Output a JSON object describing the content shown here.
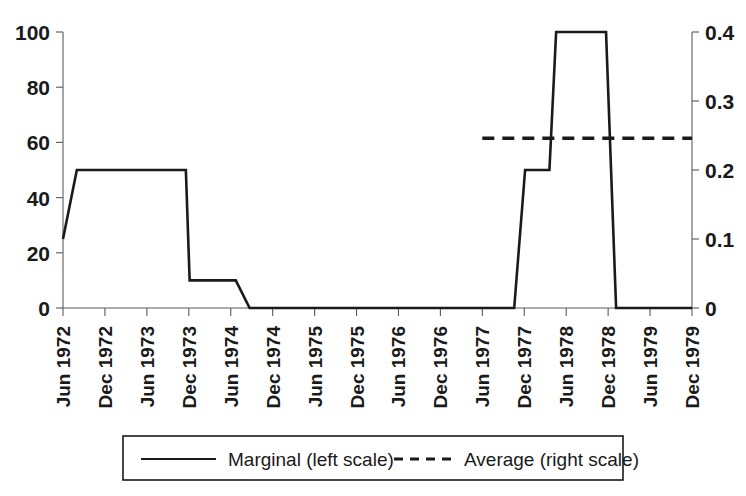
{
  "chart_data": {
    "type": "line",
    "title": "",
    "subtitle": "",
    "xlabel": "",
    "ylabel": "",
    "grid": false,
    "legend_position": "bottom",
    "x_tick_labels": [
      "Jun 1972",
      "Dec 1972",
      "Jun 1973",
      "Dec 1973",
      "Jun 1974",
      "Dec 1974",
      "Jun 1975",
      "Dec 1975",
      "Jun 1976",
      "Dec 1976",
      "Jun 1977",
      "Dec 1977",
      "Jun 1978",
      "Dec 1978",
      "Jun 1979",
      "Dec 1979"
    ],
    "left_axis": {
      "tick_labels": [
        "0",
        "20",
        "40",
        "60",
        "80",
        "100"
      ],
      "tick_values": [
        0,
        20,
        40,
        60,
        80,
        100
      ],
      "ylim": [
        0,
        100
      ]
    },
    "right_axis": {
      "tick_labels": [
        "0",
        "0.1",
        "0.2",
        "0.3",
        "0.4"
      ],
      "tick_values": [
        0,
        0.1,
        0.2,
        0.3,
        0.4
      ],
      "ylim": [
        0,
        0.4
      ]
    },
    "series": [
      {
        "name": "Marginal (left scale)",
        "axis": "left",
        "style": "solid",
        "color": "#1a1a1a",
        "points": [
          {
            "x": "Jun 1972",
            "x_index": 0.0,
            "y": 25
          },
          {
            "x": "Aug 1972",
            "x_index": 0.33,
            "y": 50
          },
          {
            "x": "Nov 1973",
            "x_index": 2.93,
            "y": 50
          },
          {
            "x": "Dec 1973",
            "x_index": 3.02,
            "y": 10
          },
          {
            "x": "Jul 1974",
            "x_index": 4.12,
            "y": 10
          },
          {
            "x": "Sep 1974",
            "x_index": 4.45,
            "y": 0
          },
          {
            "x": "Oct 1977",
            "x_index": 10.76,
            "y": 0
          },
          {
            "x": "Dec 1977",
            "x_index": 11.02,
            "y": 50
          },
          {
            "x": "Mar 1978",
            "x_index": 11.6,
            "y": 50
          },
          {
            "x": "Apr 1978",
            "x_index": 11.76,
            "y": 100
          },
          {
            "x": "Oct 1978",
            "x_index": 12.95,
            "y": 100
          },
          {
            "x": "Dec 1978",
            "x_index": 13.19,
            "y": 0
          },
          {
            "x": "Dec 1979",
            "x_index": 15.0,
            "y": 0
          }
        ]
      },
      {
        "name": "Average (right scale)",
        "axis": "right",
        "style": "dashed",
        "color": "#1a1a1a",
        "points": [
          {
            "x": "Jun 1977",
            "x_index": 10.0,
            "y": 0.246
          },
          {
            "x": "Dec 1979",
            "x_index": 15.0,
            "y": 0.246
          }
        ]
      }
    ],
    "legend": [
      {
        "label": "Marginal (left scale)",
        "style": "solid"
      },
      {
        "label": "Average (right scale)",
        "style": "dashed"
      }
    ]
  }
}
